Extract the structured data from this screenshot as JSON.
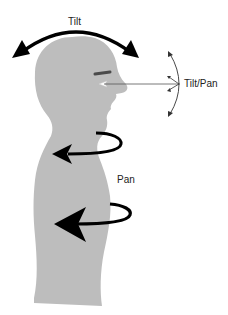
{
  "diagram": {
    "labels": {
      "tilt": "Tilt",
      "tilt_pan": "Tilt/Pan",
      "pan": "Pan"
    },
    "colors": {
      "silhouette": "#bdbdbd",
      "arrow": "#000000",
      "eyebrow": "#4a4a4a",
      "eye": "#ffffff",
      "thin_line": "#444444",
      "text": "#222222",
      "background": "#ffffff"
    },
    "elements": [
      {
        "id": "head-tilt-arrow",
        "type": "double-headed-arc",
        "label": "Tilt"
      },
      {
        "id": "gaze-line",
        "type": "line",
        "from": "eye",
        "to": "tilt-pan-arc"
      },
      {
        "id": "eye-tilt-pan-arc",
        "type": "double-headed-arc-with-ticks",
        "label": "Tilt/Pan"
      },
      {
        "id": "neck-pan-arrow",
        "type": "rotation-arrow",
        "label": "Pan"
      },
      {
        "id": "torso-pan-arrow",
        "type": "rotation-arrow",
        "label": "Pan"
      }
    ]
  }
}
